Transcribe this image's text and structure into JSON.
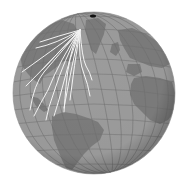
{
  "map": {
    "projection": "orthographic",
    "center": {
      "cx": 94,
      "cy": 93,
      "r": 81
    },
    "colors": {
      "background": "#ffffff",
      "ocean": "#9c9c9c",
      "land": "#7c7c7c",
      "graticule": "#707070",
      "flow_lines": "#f4f4f4",
      "pole_marker": "#111111",
      "limb_shadow": "#5a5a5a"
    },
    "flow_origin": {
      "x": 80,
      "y": 30
    },
    "features": [
      "Greenland",
      "North America",
      "South America",
      "Europe",
      "Africa"
    ],
    "flow_line_count": 14
  }
}
